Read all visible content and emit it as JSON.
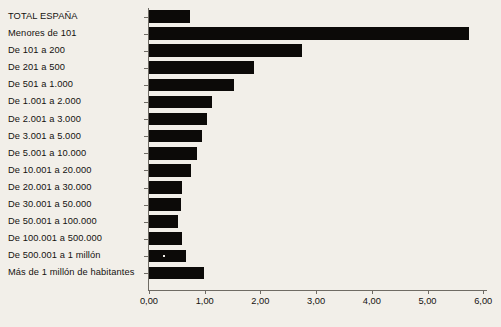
{
  "chart_data": {
    "type": "bar",
    "orientation": "horizontal",
    "title": "",
    "subtitle": "",
    "xlabel": "",
    "ylabel": "",
    "xlim": [
      0.0,
      6.0
    ],
    "grid": false,
    "legend": null,
    "legend_position": "none",
    "bar_color": "#0c0a08",
    "background_color": "#f2efe9",
    "axis_color": "#6f6b64",
    "decimal_separator": ",",
    "thousands_separator": ".",
    "x_ticks": [
      {
        "value": 0.0,
        "label": "0,00"
      },
      {
        "value": 1.0,
        "label": "1,00"
      },
      {
        "value": 2.0,
        "label": "2,00"
      },
      {
        "value": 3.0,
        "label": "3,00"
      },
      {
        "value": 4.0,
        "label": "4,00"
      },
      {
        "value": 5.0,
        "label": "5,00"
      },
      {
        "value": 6.0,
        "label": "6,00"
      }
    ],
    "categories": [
      "TOTAL ESPAÑA",
      "Menores de 101",
      "De 101 a 200",
      "De 201 a 500",
      "De 501 a 1.000",
      "De 1.001 a 2.000",
      "De 2.001 a 3.000",
      "De 3.001 a 5.000",
      "De 5.001 a 10.000",
      "De 10.001 a 20.000",
      "De 20.001 a 30.000",
      "De 30.001 a 50.000",
      "De 50.001 a 100.000",
      "De 100.001 a 500.000",
      "De 500.001 a 1 millón",
      "Más de 1 millón de habitantes"
    ],
    "values": [
      0.74,
      5.74,
      2.75,
      1.88,
      1.53,
      1.13,
      1.05,
      0.95,
      0.86,
      0.75,
      0.6,
      0.57,
      0.52,
      0.6,
      0.66,
      0.99
    ]
  }
}
